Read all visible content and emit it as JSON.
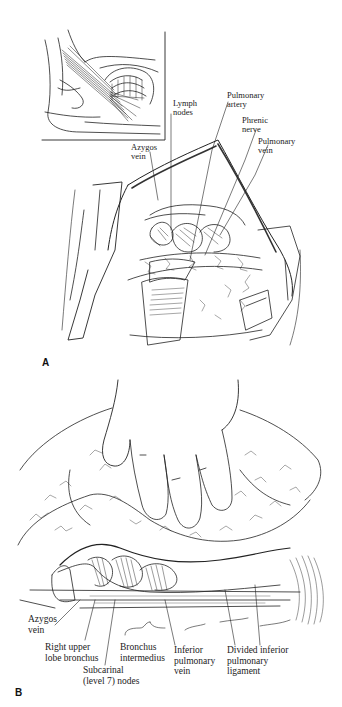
{
  "figure": {
    "panels": [
      {
        "id": "A",
        "letter": "A",
        "labels": {
          "lymph_nodes": "Lymph\nnodes",
          "pulmonary_artery": "Pulmonary\nartery",
          "phrenic_nerve": "Phrenic\nnerve",
          "pulmonary_vein": "Pulmonary\nvein",
          "azygos_vein": "Azygos\nvein"
        }
      },
      {
        "id": "B",
        "letter": "B",
        "labels": {
          "azygos_vein": "Azygos\nvein",
          "right_upper_lobe_bronchus": "Right upper\nlobe bronchus",
          "subcarinal_nodes": "Subcarinal\n(level 7) nodes",
          "bronchus_intermedius": "Bronchus\nintermedius",
          "inferior_pulmonary_vein": "Inferior\npulmonary\nvein",
          "divided_inferior_pulmonary_ligament": "Divided inferior\npulmonary\nligament"
        }
      }
    ]
  }
}
